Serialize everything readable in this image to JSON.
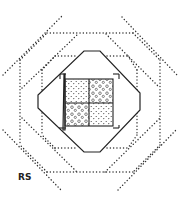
{
  "diagram": {
    "label": "RS",
    "colors": {
      "line": "#222222",
      "dots": "#333333",
      "background": "#ffffff"
    },
    "elements": [
      "outer-dotted-square-rotated",
      "outer-dotted-square-axis",
      "middle-dotted-square-rotated",
      "middle-dotted-square-axis",
      "solid-octagon",
      "inner-square-2x2-grid"
    ],
    "grid_cells": [
      {
        "position": "top-left",
        "fill": "fine-dots"
      },
      {
        "position": "top-right",
        "fill": "circles"
      },
      {
        "position": "bottom-left",
        "fill": "circles"
      },
      {
        "position": "bottom-right",
        "fill": "fine-dots"
      }
    ]
  }
}
